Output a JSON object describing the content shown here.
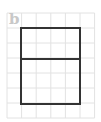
{
  "figure": {
    "label": "b",
    "grid": {
      "origin_x": 7,
      "origin_y": 13,
      "cell_w": 14.6,
      "cell_h": 15,
      "cols": 6,
      "rows": 7,
      "line_color": "#e2e2e2"
    },
    "shape": {
      "type": "rectangle-with-divider",
      "x": 21,
      "y": 28,
      "width": 59,
      "height": 76,
      "divider_y": 59,
      "stroke_color": "#333333",
      "stroke_width": 2
    }
  }
}
